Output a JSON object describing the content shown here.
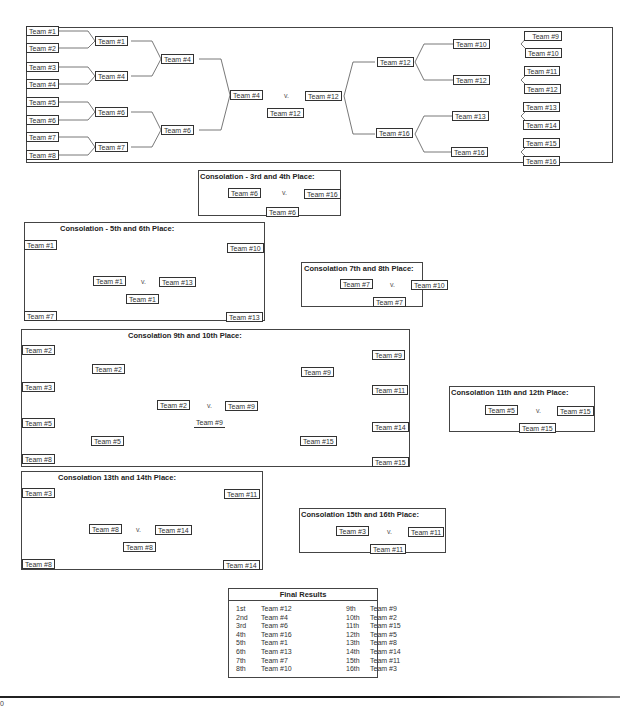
{
  "main_bracket": {
    "left_round1": [
      "Team #1",
      "Team #2",
      "Team #3",
      "Team #4",
      "Team #5",
      "Team #6",
      "Team #7",
      "Team #8"
    ],
    "left_round2": [
      "Team #1",
      "Team #4",
      "Team #6",
      "Team #7"
    ],
    "left_round3": [
      "Team #4",
      "Team #6"
    ],
    "left_final": "Team #4",
    "right_round1": [
      "Team #9",
      "Team #10",
      "Team #11",
      "Team #12",
      "Team #13",
      "Team #14",
      "Team #15",
      "Team #16"
    ],
    "right_round2": [
      "Team #10",
      "Team #12",
      "Team #13",
      "Team #16"
    ],
    "right_round3": [
      "Team #12",
      "Team #16"
    ],
    "right_final": "Team #12",
    "vs": "v.",
    "champion": "Team #12"
  },
  "consolation_3_4": {
    "title": "Consolation - 3rd and 4th Place:",
    "left": "Team #6",
    "vs": "v.",
    "right": "Team #16",
    "winner": "Team #6"
  },
  "consolation_5_6": {
    "title": "Consolation  - 5th and 6th Place:",
    "left_round1": [
      "Team #1",
      "Team #7"
    ],
    "right_round1": [
      "Team #10",
      "Team #13"
    ],
    "left": "Team #1",
    "vs": "v.",
    "right": "Team #13",
    "winner": "Team #1"
  },
  "consolation_7_8": {
    "title": "Consolation 7th and 8th Place:",
    "left": "Team #7",
    "vs": "v.",
    "right": "Team #10",
    "winner": "Team #7"
  },
  "consolation_9_10": {
    "title": "Consolation 9th and 10th Place:",
    "left_round1": [
      "Team #2",
      "Team #3",
      "Team #5",
      "Team #8"
    ],
    "left_round2": [
      "Team #2",
      "Team #5"
    ],
    "right_round1": [
      "Team #9",
      "Team #11",
      "Team #14",
      "Team #15"
    ],
    "right_round2": [
      "Team #9",
      "Team #15"
    ],
    "left": "Team #2",
    "vs": "v.",
    "right": "Team #9",
    "winner": "Team #9"
  },
  "consolation_11_12": {
    "title": "Consolation 11th and 12th Place:",
    "left": "Team #5",
    "vs": "v.",
    "right": "Team #15",
    "winner": "Team #15"
  },
  "consolation_13_14": {
    "title": "Consolation 13th and 14th Place:",
    "left_round1": [
      "Team #3",
      "Team #8"
    ],
    "right_round1": [
      "Team #11",
      "Team #14"
    ],
    "left": "Team #8",
    "vs": "v.",
    "right": "Team #14",
    "winner": "Team #8"
  },
  "consolation_15_16": {
    "title": "Consolation 15th and 16th Place:",
    "left": "Team #3",
    "vs": "v.",
    "right": "Team #11",
    "winner": "Team #11"
  },
  "final_results": {
    "title": "Final Results",
    "left": [
      {
        "place": "1st",
        "team": "Team #12"
      },
      {
        "place": "2nd",
        "team": "Team #4"
      },
      {
        "place": "3rd",
        "team": "Team #6"
      },
      {
        "place": "4th",
        "team": "Team #16"
      },
      {
        "place": "5th",
        "team": "Team #1"
      },
      {
        "place": "6th",
        "team": "Team #13"
      },
      {
        "place": "7th",
        "team": "Team #7"
      },
      {
        "place": "8th",
        "team": "Team #10"
      }
    ],
    "right": [
      {
        "place": "9th",
        "team": "Team #9"
      },
      {
        "place": "10th",
        "team": "Team #2"
      },
      {
        "place": "11th",
        "team": "Team #15"
      },
      {
        "place": "12th",
        "team": "Team #5"
      },
      {
        "place": "13th",
        "team": "Team #8"
      },
      {
        "place": "14th",
        "team": "Team #14"
      },
      {
        "place": "15th",
        "team": "Team #11"
      },
      {
        "place": "16th",
        "team": "Team #3"
      }
    ]
  },
  "footer": {
    "page_number": "0"
  }
}
